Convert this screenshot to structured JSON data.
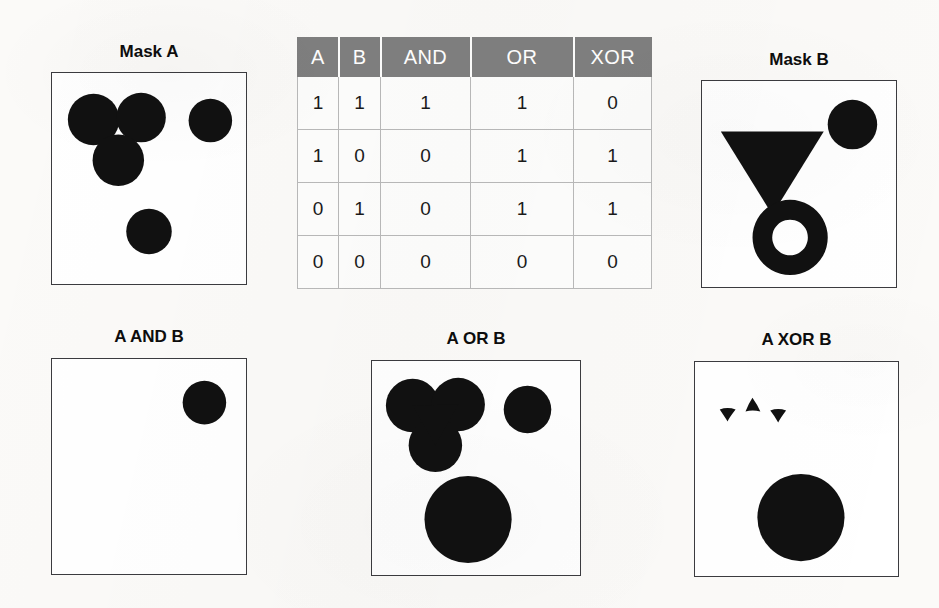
{
  "figure": {
    "kind": "mask-boolean-operations-figure",
    "background_color": "#fbfaf8",
    "shape_fill_color": "#111111",
    "panel_border_color": "#3b3b3f",
    "panel_fill_color": "#ffffff"
  },
  "panels": {
    "mask_a": {
      "title": "Mask A",
      "shapes": [
        {
          "name": "circle-top-left",
          "type": "circle",
          "cx": 42,
          "cy": 47,
          "r": 26
        },
        {
          "name": "circle-top-right",
          "type": "circle",
          "cx": 90,
          "cy": 45,
          "r": 25
        },
        {
          "name": "circle-lower-middle",
          "type": "circle",
          "cx": 67,
          "cy": 88,
          "r": 26
        },
        {
          "name": "circle-upper-right",
          "type": "circle",
          "cx": 160,
          "cy": 48,
          "r": 22
        },
        {
          "name": "circle-bottom",
          "type": "circle",
          "cx": 98,
          "cy": 160,
          "r": 23
        }
      ]
    },
    "mask_b": {
      "title": "Mask B",
      "shapes": [
        {
          "name": "triangle-down",
          "type": "triangle-down",
          "points": "19,51 123,51 71,135"
        },
        {
          "name": "circle-upper-right",
          "type": "circle",
          "cx": 152,
          "cy": 44,
          "r": 25
        },
        {
          "name": "annulus-bottom",
          "type": "annulus",
          "cx": 89,
          "cy": 158,
          "r_outer": 38,
          "r_inner": 18
        }
      ]
    },
    "a_and_b": {
      "title": "A AND B",
      "shapes": [
        {
          "name": "triangle-circle-intersection",
          "type": "compound-intersection"
        },
        {
          "name": "circle-upper-right",
          "type": "circle",
          "cx": 154,
          "cy": 44,
          "r": 22
        }
      ]
    },
    "a_or_b": {
      "title": "A OR B",
      "shapes": [
        {
          "name": "merged-circle-cluster",
          "type": "compound-union"
        },
        {
          "name": "circle-upper-right",
          "type": "circle",
          "cx": 157,
          "cy": 49,
          "r": 24
        },
        {
          "name": "circle-bottom-large",
          "type": "circle",
          "cx": 97,
          "cy": 160,
          "r": 44
        }
      ]
    },
    "a_xor_b": {
      "title": "A XOR B",
      "shapes": [
        {
          "name": "sliver-left",
          "type": "sliver-down"
        },
        {
          "name": "sliver-middle",
          "type": "sliver-up"
        },
        {
          "name": "sliver-right",
          "type": "sliver-down"
        },
        {
          "name": "circle-bottom-large",
          "type": "circle",
          "cx": 107,
          "cy": 157,
          "r": 44
        }
      ]
    }
  },
  "truth_table": {
    "header_bg": "#7f7f7f",
    "header_text_color": "#ffffff",
    "columns": [
      "A",
      "B",
      "AND",
      "OR",
      "XOR"
    ],
    "rows": [
      [
        "1",
        "1",
        "1",
        "1",
        "0"
      ],
      [
        "1",
        "0",
        "0",
        "1",
        "1"
      ],
      [
        "0",
        "1",
        "0",
        "1",
        "1"
      ],
      [
        "0",
        "0",
        "0",
        "0",
        "0"
      ]
    ]
  }
}
